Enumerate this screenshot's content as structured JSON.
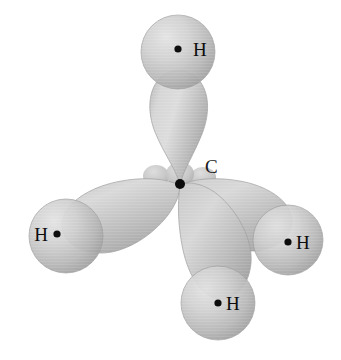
{
  "figure": {
    "name": "methane-sp3-hybrid-orbital-diagram",
    "molecule": "CH4",
    "background_color": "#ffffff",
    "lobe_color": "#c2c2c2",
    "lobe_highlight_color": "#dedede",
    "lobe_shadow_color": "#9a9a9a",
    "sphere_color": "#bfbfbf",
    "sphere_highlight_color": "#e0e0e0",
    "sphere_shadow_color": "#8f8f8f",
    "nucleus_color": "#0d0d0d"
  },
  "atoms": {
    "carbon": {
      "label": "C",
      "label_x": 205,
      "label_y": 172,
      "nucleus_x": 180,
      "nucleus_y": 184,
      "nucleus_r": 5.0
    },
    "hydrogens": [
      {
        "id": "hydrogen-top",
        "label": "H",
        "label_x": 193,
        "label_y": 55,
        "label_anchor": "start",
        "dot_x": 178,
        "dot_y": 49,
        "dot_r": 3.6,
        "center_x": 178,
        "center_y": 52,
        "radius": 37
      },
      {
        "id": "hydrogen-left",
        "label": "H",
        "label_x": 47,
        "label_y": 240,
        "label_anchor": "end",
        "dot_x": 57,
        "dot_y": 234,
        "dot_r": 3.6,
        "center_x": 66,
        "center_y": 236,
        "radius": 37
      },
      {
        "id": "hydrogen-right",
        "label": "H",
        "label_x": 296,
        "label_y": 249,
        "label_anchor": "start",
        "dot_x": 288,
        "dot_y": 242,
        "dot_r": 3.6,
        "center_x": 288,
        "center_y": 240,
        "radius": 35
      },
      {
        "id": "hydrogen-bottom",
        "label": "H",
        "label_x": 226,
        "label_y": 310,
        "label_anchor": "start",
        "dot_x": 218,
        "dot_y": 303,
        "dot_r": 3.6,
        "center_x": 218,
        "center_y": 303,
        "radius": 37
      }
    ]
  },
  "orbitals": {
    "description": "four sp3 hybrid orbital large lobes with small back lobes",
    "count": 4,
    "lobes": [
      {
        "id": "lobe-top",
        "direction": "up"
      },
      {
        "id": "lobe-left",
        "direction": "left-down"
      },
      {
        "id": "lobe-right",
        "direction": "right-down"
      },
      {
        "id": "lobe-bottom",
        "direction": "down"
      }
    ],
    "back_lobes": [
      {
        "id": "back-lobe-left"
      },
      {
        "id": "back-lobe-center"
      },
      {
        "id": "back-lobe-right"
      }
    ]
  }
}
